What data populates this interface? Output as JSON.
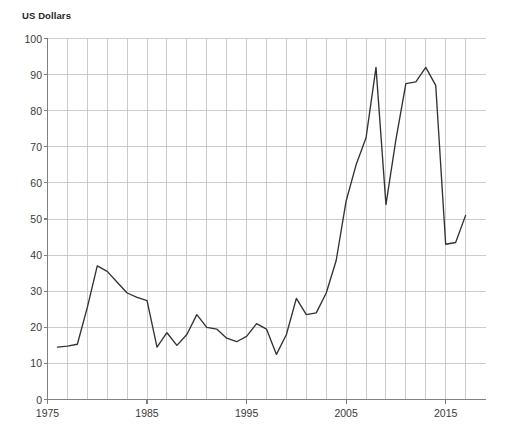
{
  "chart_data": {
    "type": "line",
    "title": "US Dollars",
    "xlabel": "",
    "ylabel": "US Dollars",
    "grid": true,
    "legend": "none",
    "xlim": [
      1975,
      1975
    ],
    "ylim": [
      0,
      100
    ],
    "y_ticks": [
      0,
      10,
      20,
      30,
      40,
      50,
      60,
      70,
      80,
      90,
      100
    ],
    "x_ticks": [
      1975,
      1985,
      1995,
      2005,
      2015
    ],
    "x_minor_step": 2,
    "line_color": "#333333",
    "grid_color": "#bfbfbf",
    "axis_color": "#808080",
    "x": [
      1976,
      1977,
      1978,
      1979,
      1980,
      1981,
      1982,
      1983,
      1984,
      1985,
      1986,
      1987,
      1988,
      1989,
      1990,
      1991,
      1992,
      1993,
      1994,
      1995,
      1996,
      1997,
      1998,
      1999,
      2000,
      2001,
      2002,
      2003,
      2004,
      2005,
      2006,
      2007,
      2008,
      2009,
      2010,
      2011,
      2012,
      2013,
      2014,
      2015,
      2016,
      2017
    ],
    "values": [
      14.5,
      14.8,
      15.3,
      25.5,
      37.0,
      35.5,
      32.5,
      29.5,
      28.3,
      27.4,
      14.5,
      18.5,
      15.0,
      18.0,
      23.5,
      20.0,
      19.5,
      17.0,
      16.0,
      17.5,
      21.0,
      19.5,
      12.5,
      18.0,
      28.0,
      23.5,
      24.0,
      29.5,
      38.5,
      55.0,
      65.0,
      72.5,
      92.0,
      54.0,
      72.0,
      87.5,
      88.0,
      92.0,
      87.0,
      43.0,
      43.5,
      51.0
    ],
    "series_name": "Crude Oil Price"
  },
  "axis_labels": {
    "y": [
      "100",
      "90",
      "80",
      "70",
      "60",
      "50",
      "40",
      "30",
      "20",
      "10",
      "0"
    ],
    "x": [
      "1975",
      "1985",
      "1995",
      "2005",
      "2015"
    ]
  }
}
